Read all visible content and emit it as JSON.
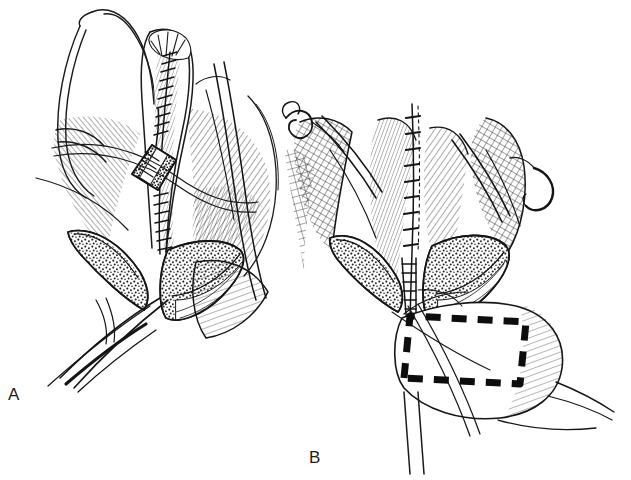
{
  "figure": {
    "type": "line-art medical illustration",
    "background_color": "#ffffff",
    "ink_color": "#1a1a1a",
    "width": 631,
    "height": 480,
    "panel_count": 2,
    "caption_present": false
  },
  "panels": [
    {
      "id": "A",
      "label": "A",
      "label_position": {
        "x": 14,
        "y": 395
      },
      "description": "Longitudinal surgical field with a closed running suture line down a central incision, a diamond shaped stippled patch graft sutured in mid field, two retracted stippled tissue flaps below, and long retractor blades with suture threads exiting lower left.",
      "bounds": {
        "x": 0,
        "y": 0,
        "width": 290,
        "height": 420
      },
      "elements": [
        {
          "name": "running-suture-line",
          "kind": "suture",
          "stitch_count": 22
        },
        {
          "name": "diamond-patch-graft",
          "kind": "graft",
          "shape": "rhomboid",
          "texture": "stippled"
        },
        {
          "name": "tissue-flap-left",
          "kind": "flap",
          "texture": "stippled"
        },
        {
          "name": "tissue-flap-right",
          "kind": "flap",
          "texture": "stippled"
        },
        {
          "name": "retractor-blade-lower-left",
          "kind": "instrument"
        },
        {
          "name": "retractor-blade-upper-right",
          "kind": "instrument"
        },
        {
          "name": "suture-thread",
          "kind": "thread",
          "count": 3
        }
      ]
    },
    {
      "id": "B",
      "label": "B",
      "label_position": {
        "x": 317,
        "y": 458
      },
      "description": "Same surgical field after closure, showing a long interrupted suture line, cross hatched fascial planes, curved needles with trailing threads at upper left and upper right, retracted stippled flaps, and a bold dashed rectangle outlining the planned flap or harvest site at lower right.",
      "bounds": {
        "x": 280,
        "y": 60,
        "width": 351,
        "height": 420
      },
      "elements": [
        {
          "name": "interrupted-suture-line",
          "kind": "suture",
          "stitch_count": 18
        },
        {
          "name": "dashed-outline-rectangle",
          "kind": "marking",
          "style": "bold dashed",
          "dash_length": 14,
          "stroke_width": 7
        },
        {
          "name": "curved-needle-upper-left",
          "kind": "instrument"
        },
        {
          "name": "curved-needle-upper-right",
          "kind": "instrument"
        },
        {
          "name": "tissue-flap-left",
          "kind": "flap",
          "texture": "stippled"
        },
        {
          "name": "tissue-flap-right",
          "kind": "flap",
          "texture": "stippled"
        },
        {
          "name": "crosshatch-fascia-left",
          "kind": "tissue",
          "texture": "cross-hatched"
        },
        {
          "name": "crosshatch-fascia-right",
          "kind": "tissue",
          "texture": "cross-hatched"
        },
        {
          "name": "suture-thread",
          "kind": "thread",
          "count": 3
        }
      ]
    }
  ]
}
